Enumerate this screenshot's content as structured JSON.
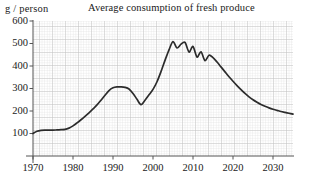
{
  "chart_data": {
    "type": "line",
    "title": "Average consumption of fresh produce",
    "ylabel": "g / person",
    "xlabel": "",
    "xlim": [
      1970,
      2035
    ],
    "ylim": [
      0,
      600
    ],
    "grid": true,
    "legend": false,
    "yticks": [
      100,
      200,
      300,
      400,
      500,
      600
    ],
    "ytick_labels": [
      "100",
      "200",
      "300",
      "400",
      "500",
      "600"
    ],
    "xticks": [
      1970,
      1980,
      1990,
      2000,
      2010,
      2020,
      2030
    ],
    "xtick_labels": [
      "1970",
      "1980",
      "1990",
      "2000",
      "2010",
      "2020",
      "2030"
    ],
    "series": [
      {
        "name": "Average consumption of fresh produce",
        "color": "#2b2b2b",
        "x": [
          1970,
          1971,
          1972,
          1973,
          1974,
          1975,
          1976,
          1977,
          1978,
          1979,
          1980,
          1981,
          1982,
          1983,
          1984,
          1985,
          1986,
          1987,
          1988,
          1989,
          1990,
          1991,
          1992,
          1993,
          1994,
          1995,
          1996,
          1997,
          1998,
          1999,
          2000,
          2001,
          2002,
          2003,
          2004,
          2005,
          2006,
          2007,
          2008,
          2009,
          2010,
          2011,
          2012,
          2013,
          2014,
          2015,
          2016,
          2017,
          2018,
          2019,
          2020,
          2021,
          2022,
          2023,
          2024,
          2025,
          2026,
          2027,
          2028,
          2029,
          2030,
          2031,
          2032,
          2033,
          2034,
          2035
        ],
        "y": [
          100,
          110,
          114,
          115,
          115,
          115,
          116,
          117,
          118,
          124,
          134,
          147,
          161,
          176,
          192,
          209,
          227,
          248,
          270,
          291,
          303,
          307,
          307,
          305,
          298,
          278,
          252,
          228,
          248,
          272,
          296,
          330,
          375,
          425,
          472,
          508,
          480,
          497,
          505,
          462,
          487,
          440,
          463,
          424,
          448,
          437,
          418,
          396,
          374,
          352,
          332,
          313,
          295,
          278,
          263,
          250,
          239,
          229,
          221,
          214,
          208,
          203,
          198,
          194,
          190,
          186
        ]
      }
    ]
  },
  "plot": {
    "x_axis_min_year": 1970,
    "x_axis_max_year": 2035,
    "y_axis_min": 0,
    "y_axis_max": 600,
    "grid_minor_color": "#d8d8d8",
    "grid_major_color": "#b9b9b9",
    "axis_color": "#555555",
    "line_color": "#2b2b2b"
  }
}
